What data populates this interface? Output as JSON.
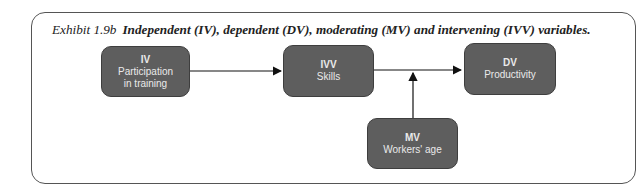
{
  "title": {
    "label": "Exhibit 1.9b",
    "text": "Independent (IV), dependent (DV), moderating (MV) and intervening (IVV) variables."
  },
  "nodes": {
    "iv": {
      "code": "IV",
      "line1": "Participation",
      "line2": "in training"
    },
    "ivv": {
      "code": "IVV",
      "line1": "Skills"
    },
    "dv": {
      "code": "DV",
      "line1": "Productivity"
    },
    "mv": {
      "code": "MV",
      "line1": "Workers' age"
    }
  },
  "colors": {
    "box": "#5e5e5e",
    "arrow": "#111111",
    "frame": "#555555"
  }
}
